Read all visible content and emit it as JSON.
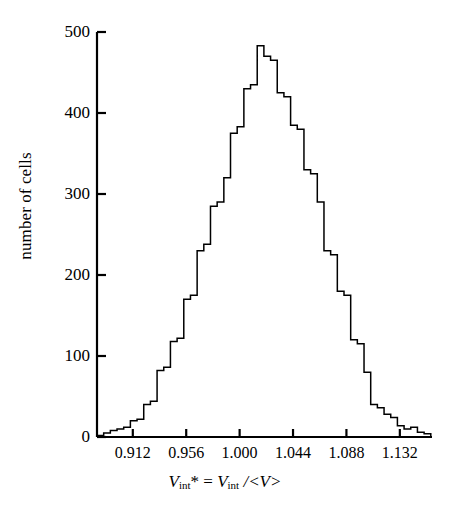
{
  "chart_data": {
    "type": "bar",
    "title": "",
    "subtitle": "",
    "xlabel": "V_int* = V_int /<V>",
    "xlabel_parts": {
      "v1": "V",
      "sub1": "int",
      "star": "*",
      "eq": " = ",
      "v2": "V",
      "sub2": "int",
      "tail": " /<V>"
    },
    "ylabel": "number of cells",
    "xlim": [
      0.8825,
      1.1585
    ],
    "ylim": [
      0,
      500
    ],
    "grid": false,
    "legend": null,
    "xticks": [
      0.912,
      0.956,
      1.0,
      1.044,
      1.088,
      1.132
    ],
    "xtick_labels": [
      "0.912",
      "0.956",
      "1.000",
      "1.044",
      "1.088",
      "1.132"
    ],
    "yticks": [
      0,
      100,
      200,
      300,
      400,
      500
    ],
    "ytick_labels": [
      "0",
      "100",
      "200",
      "300",
      "400",
      "500"
    ],
    "bin_width": 0.0055,
    "bin_starts": [
      0.8825,
      0.888,
      0.8935,
      0.899,
      0.9045,
      0.91,
      0.9155,
      0.921,
      0.9265,
      0.932,
      0.9375,
      0.943,
      0.9485,
      0.954,
      0.9595,
      0.965,
      0.9705,
      0.976,
      0.9815,
      0.987,
      0.9925,
      0.998,
      1.0035,
      1.009,
      1.0145,
      1.02,
      1.0255,
      1.031,
      1.0365,
      1.042,
      1.0475,
      1.053,
      1.0585,
      1.064,
      1.0695,
      1.075,
      1.0805,
      1.086,
      1.0915,
      1.097,
      1.1025,
      1.108,
      1.1135,
      1.119,
      1.1245,
      1.13,
      1.1355,
      1.141,
      1.1465,
      1.152
    ],
    "values": [
      2,
      5,
      8,
      10,
      12,
      20,
      22,
      40,
      44,
      82,
      86,
      118,
      122,
      170,
      175,
      230,
      238,
      285,
      290,
      320,
      375,
      383,
      430,
      435,
      483,
      470,
      465,
      425,
      420,
      385,
      380,
      330,
      325,
      290,
      230,
      225,
      180,
      175,
      120,
      115,
      80,
      40,
      36,
      28,
      24,
      14,
      10,
      12,
      6,
      4
    ],
    "line_color": "#000000",
    "axis_color": "#000000",
    "background": "#ffffff"
  }
}
